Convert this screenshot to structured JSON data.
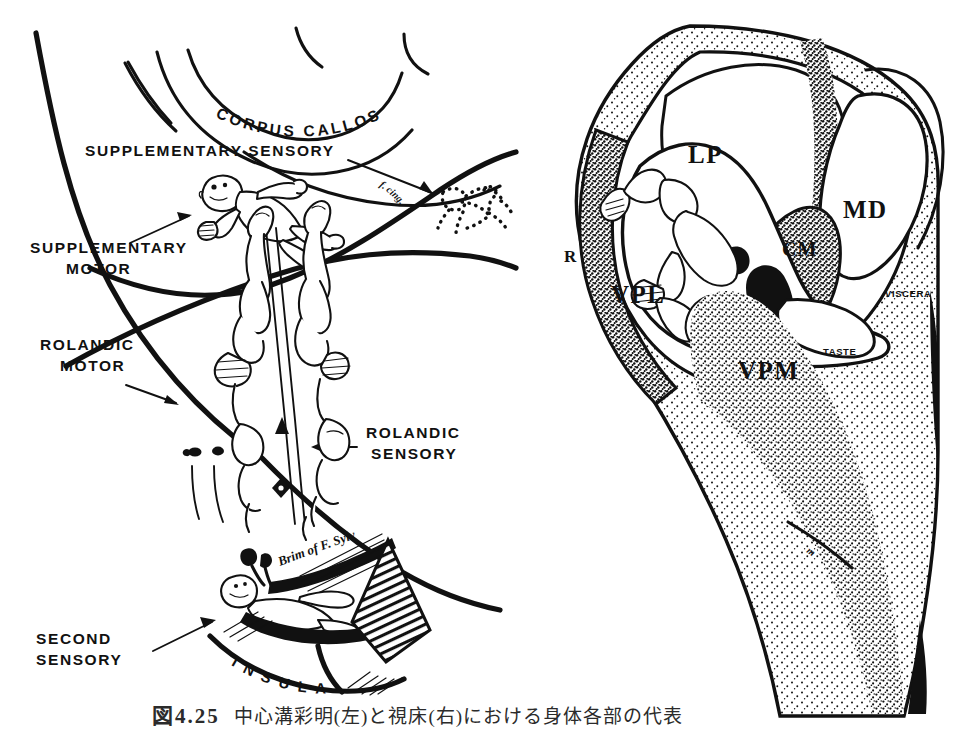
{
  "figure": {
    "domain": "Diagram",
    "background_color": "#ffffff",
    "ink_color": "#111111",
    "width": 968,
    "height": 731
  },
  "left_panel": {
    "name": "medial-cortex-homunculus-diagram",
    "labels": {
      "corpus_callosum": "CORPUS CALLOSUM",
      "supplementary_sensory": "SUPPLEMENTARY SENSORY",
      "supplementary_motor_line1": "SUPPLEMENTARY",
      "supplementary_motor_line2": "MOTOR",
      "rolandic_motor_line1": "ROLANDIC",
      "rolandic_motor_line2": "MOTOR",
      "rolandic_sensory_line1": "ROLANDIC",
      "rolandic_sensory_line2": "SENSORY",
      "second_sensory_line1": "SECOND",
      "second_sensory_line2": "SENSORY",
      "insula": "INSULA",
      "insula_letters": [
        "I",
        "N",
        "S",
        "U",
        "L",
        "A"
      ],
      "brim_of_fissure": "Brim of F. Sylvii",
      "fasciculus_cingulum": "f. cing."
    },
    "figures": {
      "supplementary_motor_homunculus": "supine-infant-homunculus",
      "supplementary_sensory_homunculus": "dotted-outline-homunculus",
      "rolandic_strip_homunculi": "paired-precentral-postcentral-homunculi",
      "second_sensory_homunculus": "reclining-homunculus-in-sylvian-brim"
    }
  },
  "right_panel": {
    "name": "thalamus-cross-section-diagram",
    "nuclei": [
      {
        "abbr": "LP",
        "name": "lateral-posterior-nucleus"
      },
      {
        "abbr": "MD",
        "name": "mediodorsal-nucleus"
      },
      {
        "abbr": "CM",
        "name": "centromedian-nucleus"
      },
      {
        "abbr": "VPL",
        "name": "ventral-posterolateral-nucleus"
      },
      {
        "abbr": "VPM",
        "name": "ventral-posteromedial-nucleus"
      },
      {
        "abbr": "R",
        "name": "reticular-nucleus"
      }
    ],
    "modality_labels": {
      "taste": "TASTE",
      "viscera": "VISCERA"
    },
    "figures": {
      "thalamic_homunculus": "sensory-homunculus-within-VPL-VPM"
    }
  },
  "caption": {
    "figure_number": "図4.25",
    "text": "中心溝彩明(左)と視床(右)における身体各部の代表"
  }
}
